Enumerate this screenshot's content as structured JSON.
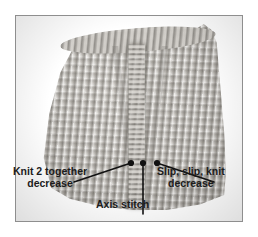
{
  "figure": {
    "type": "instructional-photograph",
    "frame_border_color": "#8e8e8e",
    "background_color": "#ffffff"
  },
  "photo": {
    "yarn_color": "#b9b6b1",
    "yarn_shadow_color": "#8a8781",
    "yarn_highlight_color": "#d2cfca"
  },
  "annotations": {
    "marker_color": "#111111",
    "leader_color": "#111111",
    "items": [
      {
        "id": "knit-2-together",
        "line1": "Knit 2 together",
        "line2": "decrease",
        "dot": {
          "x": 115,
          "y": 147
        },
        "elbow": {
          "x": 58,
          "y": 166
        }
      },
      {
        "id": "axis-stitch",
        "line1": "Axis stitch",
        "line2": "",
        "dot": {
          "x": 127,
          "y": 147
        },
        "elbow": {
          "x": 127,
          "y": 198
        }
      },
      {
        "id": "slip-slip-knit",
        "line1": "Slip, slip, knit",
        "line2": "decrease",
        "dot": {
          "x": 141,
          "y": 147
        },
        "elbow": {
          "x": 198,
          "y": 166
        }
      }
    ]
  }
}
